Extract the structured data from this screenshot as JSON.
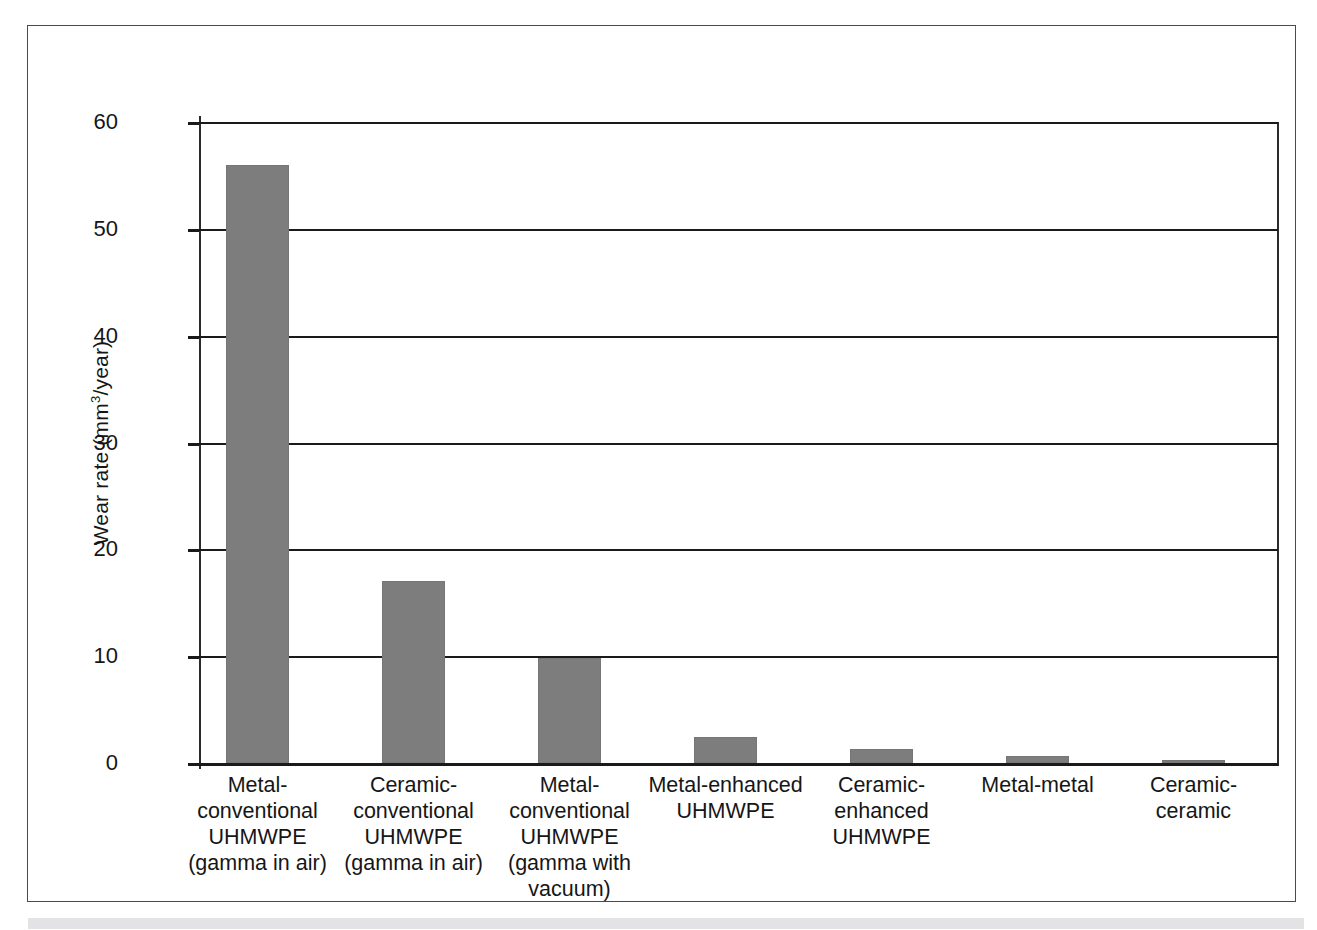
{
  "figure": {
    "background_color": "#ffffff",
    "frame_color": "#4a4a4a",
    "bottom_strip_color": "#e3e3e5"
  },
  "chart_data": {
    "type": "bar",
    "title": "",
    "subtitle": "",
    "xlabel": "",
    "ylabel": "Wear rate (mm3/year)",
    "ylabel_parts": {
      "before": "Wear rate (mm",
      "superscript": "3",
      "after": "/year)"
    },
    "categories": [
      "Metal-\nconventional\nUHMWPE\n(gamma in air)",
      "Ceramic-\nconventional\nUHMWPE\n(gamma in air)",
      "Metal-\nconventional\nUHMWPE\n(gamma with\nvacuum)",
      "Metal-enhanced\nUHMWPE",
      "Ceramic-\nenhanced\nUHMWPE",
      "Metal-metal",
      "Ceramic-\nceramic"
    ],
    "values": [
      56,
      17,
      9.8,
      2.4,
      1.3,
      0.7,
      0.25
    ],
    "ylim": [
      0,
      60
    ],
    "yticks": [
      0,
      10,
      20,
      30,
      40,
      50,
      60
    ],
    "ytick_labels": [
      "0",
      "10",
      "20",
      "30",
      "40",
      "50",
      "60"
    ],
    "grid": true,
    "grid_axis": "y",
    "legend": false,
    "legend_position": "none",
    "bar_color": "#7d7d7d",
    "axis_color": "#1a1a1a",
    "bar_width_px": 63,
    "bar_pitch_px": 156
  }
}
